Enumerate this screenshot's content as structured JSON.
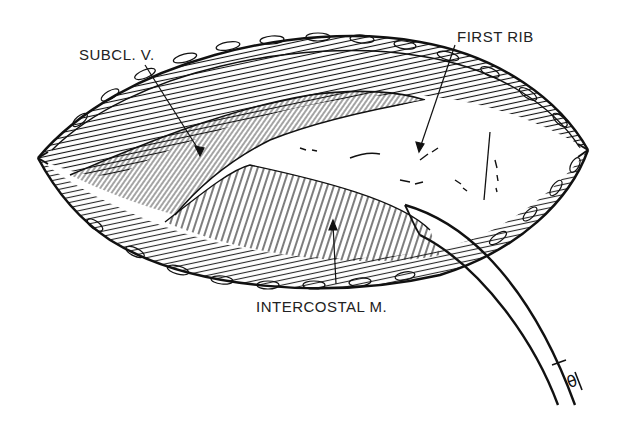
{
  "figure": {
    "type": "surgical line illustration",
    "labels": {
      "subclavian_vein": "SUBCL. V.",
      "first_rib": "FIRST RIB",
      "intercostal_muscle": "INTERCOSTAL M."
    },
    "instrument_marking": "θ",
    "colors": {
      "ink": "#111111",
      "paper": "#ffffff"
    }
  }
}
